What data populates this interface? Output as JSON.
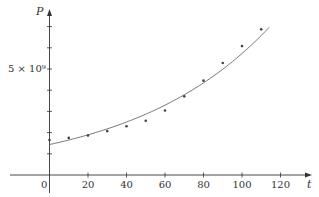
{
  "chart_data": {
    "type": "scatter",
    "title": "",
    "xlabel": "t",
    "ylabel": "P",
    "x_ticks": [
      0,
      20,
      40,
      60,
      80,
      100,
      120
    ],
    "y_ticks": [
      1,
      2,
      3,
      4,
      5,
      6,
      7
    ],
    "y_tick_labels": [
      {
        "value": 5,
        "label": "5 × 10⁹"
      }
    ],
    "y_scale": 1000000000,
    "xlim": [
      -20,
      138
    ],
    "ylim": [
      -0.9,
      7.7
    ],
    "grid": false,
    "legend": null,
    "series": [
      {
        "name": "data points",
        "kind": "scatter",
        "x": [
          0,
          10,
          20,
          30,
          40,
          50,
          60,
          70,
          80,
          90,
          100,
          110
        ],
        "y": [
          1.65,
          1.75,
          1.86,
          2.07,
          2.3,
          2.56,
          3.04,
          3.71,
          4.45,
          5.28,
          6.08,
          6.87
        ]
      },
      {
        "name": "exponential fit",
        "kind": "line",
        "model": "P = a·e^(k t)",
        "a": 1.436,
        "k": 0.01384,
        "x_range": [
          0,
          114
        ]
      }
    ]
  },
  "colors": {
    "axis": "#333333",
    "curve": "#666666",
    "point": "#444444"
  },
  "labels": {
    "origin": "0",
    "y_axis": "P",
    "x_axis": "t",
    "y_five": "5 × 10⁹"
  }
}
